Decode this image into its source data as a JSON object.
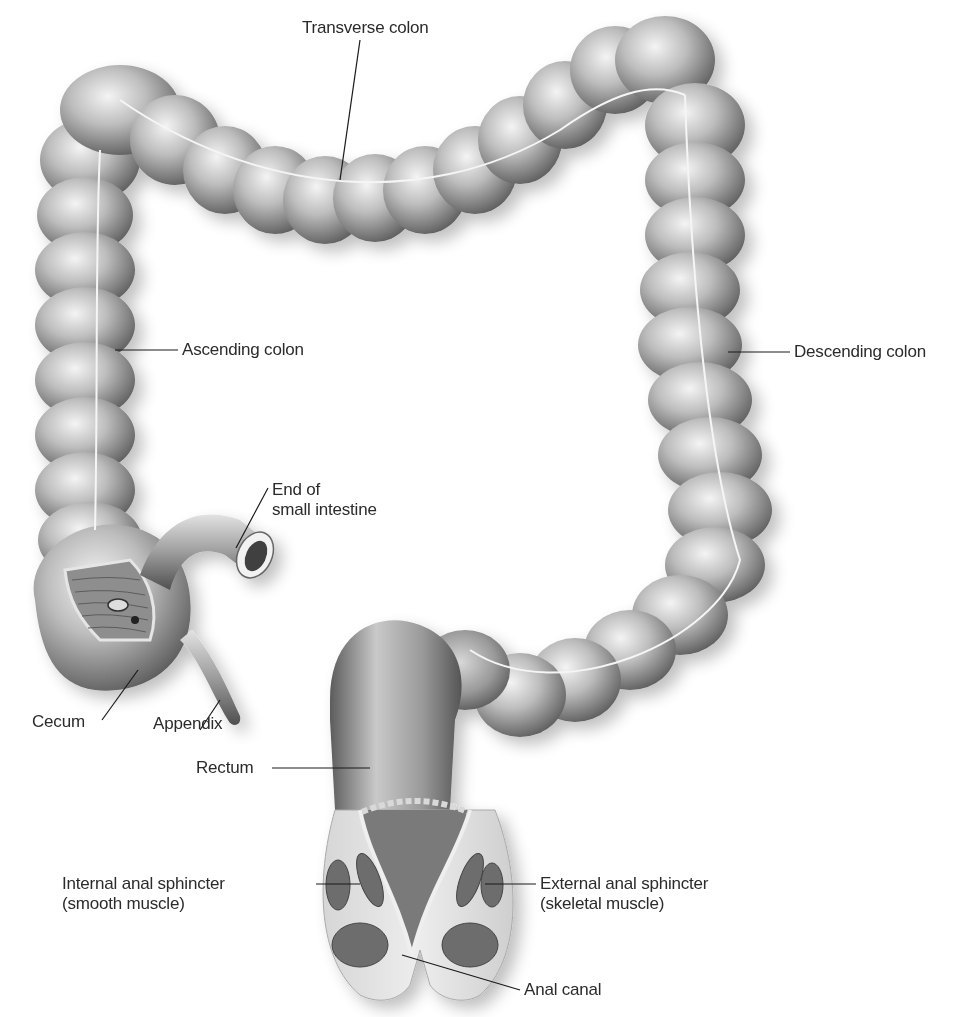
{
  "figure": {
    "labels": {
      "transverse_colon": "Transverse colon",
      "ascending_colon": "Ascending colon",
      "descending_colon": "Descending colon",
      "end_small_intestine_line1": "End of",
      "end_small_intestine_line2": "small intestine",
      "cecum": "Cecum",
      "appendix": "Appendix",
      "rectum": "Rectum",
      "internal_sphincter_line1": "Internal anal sphincter",
      "internal_sphincter_line2": "(smooth muscle)",
      "external_sphincter_line1": "External anal sphincter",
      "external_sphincter_line2": "(skeletal muscle)",
      "anal_canal": "Anal canal"
    },
    "colors": {
      "tissue_light": "#e6e6e6",
      "tissue_mid": "#a9a9a9",
      "tissue_dark": "#5e5e5e",
      "leader_line": "#1a1a1a",
      "label_text": "#2b2b2b",
      "background": "#ffffff"
    }
  }
}
